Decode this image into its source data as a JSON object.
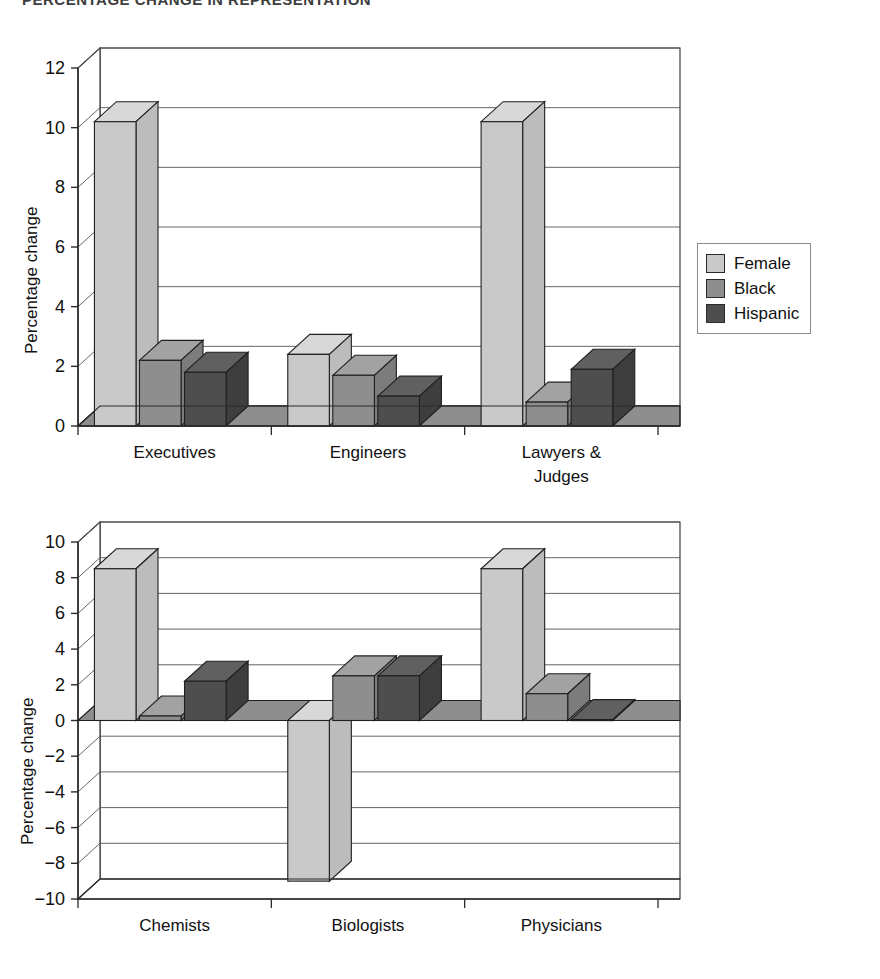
{
  "page": {
    "clipped_header_text": "PERCENTAGE CHANGE IN REPRESENTATION"
  },
  "colors": {
    "female": "#c9c9c9",
    "black": "#8e8e8e",
    "hispanic": "#4e4e4e",
    "female_top": "#d8d8d8",
    "black_top": "#a2a2a2",
    "hispanic_top": "#606060",
    "female_side": "#bcbcbc",
    "black_side": "#7c7c7c",
    "hispanic_side": "#3e3e3e",
    "floor": "#8e8e8e",
    "outline": "#1f1f1f",
    "gridline": "#555555",
    "axis": "#2b2b2b"
  },
  "legend": {
    "items": [
      {
        "label": "Female",
        "key": "female"
      },
      {
        "label": "Black",
        "key": "black"
      },
      {
        "label": "Hispanic",
        "key": "hispanic"
      }
    ]
  },
  "chart_data": [
    {
      "id": "chart-top",
      "type": "bar",
      "title": "",
      "xlabel": "",
      "ylabel": "Percentage change",
      "ylim": [
        0,
        12
      ],
      "yticks": [
        0,
        2,
        4,
        6,
        8,
        10,
        12
      ],
      "ytick_labels": [
        "0",
        "2",
        "4",
        "6",
        "8",
        "10",
        "12"
      ],
      "grid": true,
      "legend_position": "right",
      "categories": [
        "Executives",
        "Engineers",
        "Lawyers & Judges"
      ],
      "category_lines": [
        [
          "Executives"
        ],
        [
          "Engineers"
        ],
        [
          "Lawyers &",
          "Judges"
        ]
      ],
      "series": [
        {
          "name": "Female",
          "values": [
            10.2,
            2.4,
            10.2
          ]
        },
        {
          "name": "Black",
          "values": [
            2.2,
            1.7,
            0.8
          ]
        },
        {
          "name": "Hispanic",
          "values": [
            1.8,
            1.0,
            1.9
          ]
        }
      ]
    },
    {
      "id": "chart-bottom",
      "type": "bar",
      "title": "",
      "xlabel": "",
      "ylabel": "Percentage change",
      "ylim": [
        -10,
        10
      ],
      "yticks": [
        10,
        8,
        6,
        4,
        2,
        0,
        -2,
        -4,
        -6,
        -8,
        -10
      ],
      "ytick_labels": [
        "10",
        "8",
        "6",
        "4",
        "2",
        "0",
        "−2",
        "−4",
        "−6",
        "−8",
        "−10"
      ],
      "grid": true,
      "legend_position": "right",
      "categories": [
        "Chemists",
        "Biologists",
        "Physicians"
      ],
      "category_lines": [
        [
          "Chemists"
        ],
        [
          "Biologists"
        ],
        [
          "Physicians"
        ]
      ],
      "series": [
        {
          "name": "Female",
          "values": [
            8.5,
            -9.0,
            8.5
          ]
        },
        {
          "name": "Black",
          "values": [
            0.25,
            2.5,
            1.5
          ]
        },
        {
          "name": "Hispanic",
          "values": [
            2.2,
            2.5,
            0.05
          ]
        }
      ]
    }
  ]
}
